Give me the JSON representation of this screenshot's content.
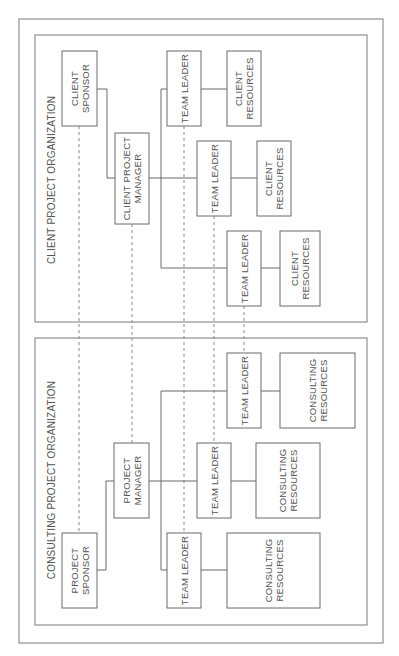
{
  "diagram": {
    "rotation_deg": -90,
    "outer_frame": {
      "x": 19,
      "y": 19,
      "w": 364,
      "h": 624
    },
    "panels": [
      {
        "id": "client",
        "title": "CLIENT PROJECT ORGANIZATION",
        "frame": {
          "x": 35,
          "y": 35,
          "w": 332,
          "h": 287
        },
        "title_pos": {
          "x": 51,
          "y": 180
        },
        "boxes": [
          {
            "id": "client-sponsor",
            "lines": [
              "CLIENT",
              "SPONSOR"
            ],
            "x": 62,
            "y": 51,
            "w": 35,
            "h": 75
          },
          {
            "id": "client-project-manager",
            "lines": [
              "CLIENT PROJECT",
              "MANAGER"
            ],
            "x": 115,
            "y": 133,
            "w": 34,
            "h": 91
          },
          {
            "id": "client-team-leader-1",
            "lines": [
              "TEAM LEADER"
            ],
            "x": 167,
            "y": 51,
            "w": 34,
            "h": 75
          },
          {
            "id": "client-resources-1",
            "lines": [
              "CLIENT",
              "RESOURCES"
            ],
            "x": 227,
            "y": 51,
            "w": 34,
            "h": 75
          },
          {
            "id": "client-team-leader-2",
            "lines": [
              "TEAM LEADER"
            ],
            "x": 197,
            "y": 141,
            "w": 34,
            "h": 75
          },
          {
            "id": "client-resources-2",
            "lines": [
              "CLIENT",
              "RESOURCES"
            ],
            "x": 257,
            "y": 141,
            "w": 34,
            "h": 75
          },
          {
            "id": "client-team-leader-3",
            "lines": [
              "TEAM LEADER"
            ],
            "x": 227,
            "y": 231,
            "w": 34,
            "h": 75
          },
          {
            "id": "client-resources-3",
            "lines": [
              "CLIENT",
              "RESOURCES"
            ],
            "x": 280,
            "y": 231,
            "w": 40,
            "h": 75
          }
        ]
      },
      {
        "id": "consulting",
        "title": "CONSULTING PROJECT ORGANIZATION",
        "frame": {
          "x": 35,
          "y": 338,
          "w": 332,
          "h": 287
        },
        "title_pos": {
          "x": 51,
          "y": 480
        },
        "boxes": [
          {
            "id": "project-sponsor",
            "lines": [
              "PROJECT",
              "SPONSOR"
            ],
            "x": 62,
            "y": 533,
            "w": 35,
            "h": 75
          },
          {
            "id": "project-manager",
            "lines": [
              "PROJECT",
              "MANAGER"
            ],
            "x": 114,
            "y": 443,
            "w": 35,
            "h": 75
          },
          {
            "id": "consulting-team-leader-1",
            "lines": [
              "TEAM LEADER"
            ],
            "x": 167,
            "y": 533,
            "w": 34,
            "h": 75
          },
          {
            "id": "consulting-resources-1",
            "lines": [
              "CONSULTING",
              "RESOURCES"
            ],
            "x": 227,
            "y": 533,
            "w": 93,
            "h": 75
          },
          {
            "id": "consulting-team-leader-2",
            "lines": [
              "TEAM LEADER"
            ],
            "x": 197,
            "y": 443,
            "w": 34,
            "h": 75
          },
          {
            "id": "consulting-resources-2",
            "lines": [
              "CONSULTING",
              "RESOURCES"
            ],
            "x": 256,
            "y": 443,
            "w": 64,
            "h": 75
          },
          {
            "id": "consulting-team-leader-3",
            "lines": [
              "TEAM LEADER"
            ],
            "x": 227,
            "y": 353,
            "w": 34,
            "h": 75
          },
          {
            "id": "consulting-resources-3",
            "lines": [
              "CONSULTING",
              "RESOURCES"
            ],
            "x": 280,
            "y": 353,
            "w": 75,
            "h": 75
          }
        ]
      }
    ],
    "connectors": [
      {
        "points": [
          [
            97,
            89
          ],
          [
            107,
            89
          ],
          [
            107,
            178
          ],
          [
            115,
            178
          ]
        ]
      },
      {
        "points": [
          [
            149,
            178
          ],
          [
            197,
            178
          ]
        ]
      },
      {
        "points": [
          [
            167,
            89
          ],
          [
            161,
            89
          ],
          [
            161,
            268
          ],
          [
            227,
            268
          ]
        ]
      },
      {
        "points": [
          [
            201,
            89
          ],
          [
            227,
            89
          ]
        ]
      },
      {
        "points": [
          [
            231,
            178
          ],
          [
            257,
            178
          ]
        ]
      },
      {
        "points": [
          [
            261,
            268
          ],
          [
            280,
            268
          ]
        ]
      },
      {
        "points": [
          [
            97,
            570
          ],
          [
            106,
            570
          ],
          [
            106,
            481
          ],
          [
            114,
            481
          ]
        ]
      },
      {
        "points": [
          [
            149,
            481
          ],
          [
            197,
            481
          ]
        ]
      },
      {
        "points": [
          [
            167,
            570
          ],
          [
            161,
            570
          ],
          [
            161,
            391
          ],
          [
            227,
            391
          ]
        ]
      },
      {
        "points": [
          [
            201,
            570
          ],
          [
            227,
            570
          ]
        ]
      },
      {
        "points": [
          [
            231,
            481
          ],
          [
            256,
            481
          ]
        ]
      },
      {
        "points": [
          [
            261,
            391
          ],
          [
            280,
            391
          ]
        ]
      }
    ],
    "dotted_links": [
      {
        "from": "client-sponsor",
        "to": "project-sponsor",
        "x": 79,
        "y1": 126,
        "y2": 533
      },
      {
        "from": "client-project-manager",
        "to": "project-manager",
        "x": 132,
        "y1": 224,
        "y2": 443
      },
      {
        "from": "client-team-leader-1",
        "to": "consulting-team-leader-1",
        "x": 184,
        "y1": 126,
        "y2": 533
      },
      {
        "from": "client-team-leader-2",
        "to": "consulting-team-leader-2",
        "x": 214,
        "y1": 216,
        "y2": 443
      },
      {
        "from": "client-team-leader-3",
        "to": "consulting-team-leader-3",
        "x": 244,
        "y1": 306,
        "y2": 353
      }
    ]
  }
}
